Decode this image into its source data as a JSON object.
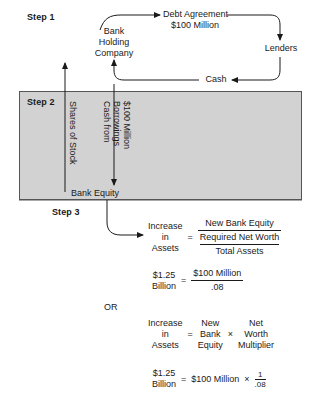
{
  "diagram": {
    "steps": {
      "step1_label": "Step 1",
      "step2_label": "Step 2",
      "step3_label": "Step 3"
    },
    "step1": {
      "entity_line1": "Bank",
      "entity_line2": "Holding",
      "entity_line3": "Company",
      "debt_line1": "Debt Agreement",
      "debt_line2": "$100 Million",
      "lenders": "Lenders",
      "cash": "Cash"
    },
    "step2": {
      "shares_label": "Shares of Stock",
      "cash_label_line1": "Cash from",
      "cash_label_line2": "Borrowings",
      "cash_label_line3": "$100 Million",
      "bank_equity": "Bank Equity"
    },
    "step3": {
      "or_label": "OR",
      "formula1": {
        "lhs_line1": "Increase",
        "lhs_line2": "in",
        "lhs_line3": "Assets",
        "equals": "=",
        "numerator": "New Bank Equity",
        "sub_numerator": "Required Net Worth",
        "sub_denominator": "Total Assets"
      },
      "formula2": {
        "lhs_line1": "$1.25",
        "lhs_line2": "Billion",
        "equals": "=",
        "numerator": "$100 Million",
        "denominator": ".08"
      },
      "formula3": {
        "lhs_line1": "Increase",
        "lhs_line2": "in",
        "lhs_line3": "Assets",
        "equals": "=",
        "mid_line1": "New",
        "mid_line2": "Bank",
        "mid_line3": "Equity",
        "times": "×",
        "rhs_line1": "Net",
        "rhs_line2": "Worth",
        "rhs_line3": "Multiplier"
      },
      "formula4": {
        "lhs_line1": "$1.25",
        "lhs_line2": "Billion",
        "equals": "=",
        "value": "$100 Million",
        "times": "×",
        "frac_num": "1",
        "frac_den": ".08"
      }
    },
    "colors": {
      "shade_fill": "#d2d2d2",
      "line": "#1a1a1a",
      "border": "#555555",
      "text": "#1a1a1a"
    }
  }
}
